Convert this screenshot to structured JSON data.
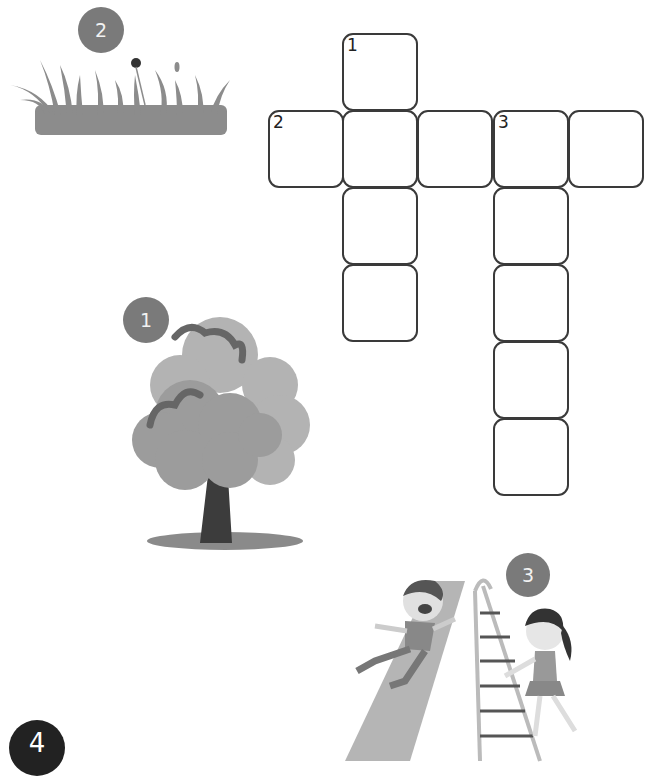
{
  "puzzle": {
    "type": "crossword",
    "cells": [
      {
        "x": 342,
        "y": 33,
        "num": "1"
      },
      {
        "x": 268,
        "y": 110,
        "num": "2"
      },
      {
        "x": 342,
        "y": 110,
        "num": ""
      },
      {
        "x": 417,
        "y": 110,
        "num": ""
      },
      {
        "x": 493,
        "y": 110,
        "num": "3"
      },
      {
        "x": 568,
        "y": 110,
        "num": ""
      },
      {
        "x": 342,
        "y": 187,
        "num": ""
      },
      {
        "x": 342,
        "y": 264,
        "num": ""
      },
      {
        "x": 493,
        "y": 187,
        "num": ""
      },
      {
        "x": 493,
        "y": 264,
        "num": ""
      },
      {
        "x": 493,
        "y": 341,
        "num": ""
      },
      {
        "x": 493,
        "y": 418,
        "num": ""
      }
    ]
  },
  "clues": [
    {
      "number": "1",
      "picture": "tree-icon"
    },
    {
      "number": "2",
      "picture": "grass-icon"
    },
    {
      "number": "3",
      "picture": "slide-icon"
    },
    {
      "number": "4",
      "picture": ""
    }
  ],
  "colors": {
    "badge": "#7a7a7a",
    "badge_dark": "#222222",
    "cell_border": "#3a3a3a",
    "grass": "#8c8c8c",
    "tree_light": "#b0b0b0",
    "tree_mid": "#9c9c9c",
    "trunk": "#3c3c3c"
  }
}
